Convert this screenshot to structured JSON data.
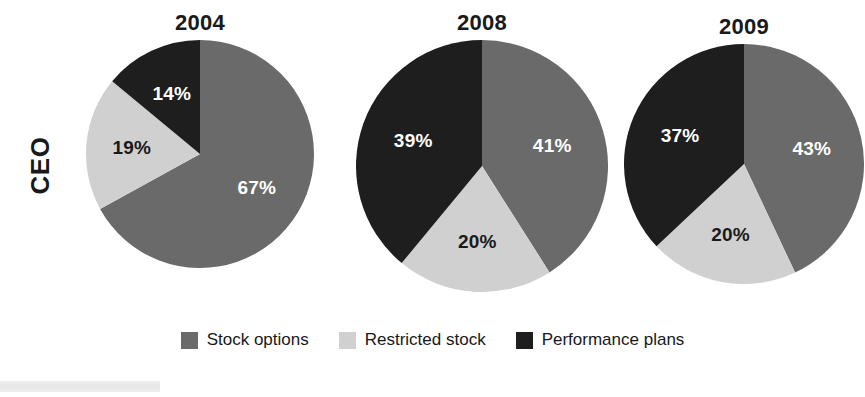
{
  "row_label": "CEO",
  "legend": {
    "items": [
      {
        "label": "Stock options",
        "color": "#6a6a6a"
      },
      {
        "label": "Restricted stock",
        "color": "#d0d0d0"
      },
      {
        "label": "Performance plans",
        "color": "#1e1e1e"
      }
    ]
  },
  "chart_data": {
    "type": "pie",
    "title": "",
    "row_label": "CEO",
    "start_angle_deg": 0,
    "direction": "clockwise",
    "legend_position": "bottom-center",
    "categories": [
      "Stock options",
      "Restricted stock",
      "Performance plans"
    ],
    "colors": [
      "#6a6a6a",
      "#d0d0d0",
      "#1e1e1e"
    ],
    "label_colors": [
      "#ffffff",
      "#1a1a1a",
      "#ffffff"
    ],
    "units": "percent",
    "panels": [
      {
        "title": "2004",
        "values": [
          67,
          19,
          14
        ],
        "labels": [
          "67%",
          "19%",
          "14%"
        ]
      },
      {
        "title": "2008",
        "values": [
          41,
          20,
          39
        ],
        "labels": [
          "41%",
          "20%",
          "39%"
        ]
      },
      {
        "title": "2009",
        "values": [
          43,
          20,
          37
        ],
        "labels": [
          "43%",
          "20%",
          "37%"
        ]
      }
    ]
  }
}
